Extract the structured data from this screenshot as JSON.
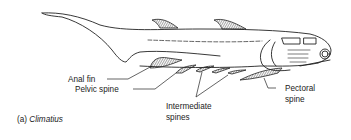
{
  "figure": {
    "subject": "Climatius",
    "caption": {
      "prefix": "(a)",
      "name": "Climatius"
    },
    "labels": {
      "anal_fin": "Anal fin",
      "pelvic_spine": "Pelvic spine",
      "intermediate_line1": "Intermediate",
      "intermediate_line2": "spines",
      "pectoral_line1": "Pectoral",
      "pectoral_line2": "spine"
    },
    "colors": {
      "ink": "#222222",
      "background": "#ffffff"
    }
  }
}
